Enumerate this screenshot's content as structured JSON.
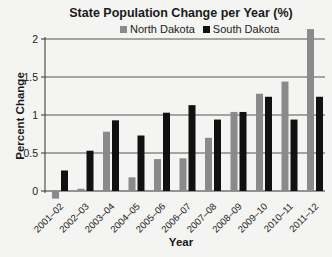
{
  "chart_data": {
    "type": "bar",
    "title": "State Population Change per Year (%)",
    "xlabel": "Year",
    "ylabel": "Percent Change",
    "ylim": [
      0,
      2
    ],
    "yticks": [
      0,
      0.5,
      1,
      1.5,
      2
    ],
    "ytick_labels": [
      "0",
      "0.5",
      "1",
      "1.5",
      "2"
    ],
    "grid": true,
    "legend_position": "top",
    "categories": [
      "2001–02",
      "2002–03",
      "2003–04",
      "2004–05",
      "2005–06",
      "2006–07",
      "2007–08",
      "2008–09",
      "2009–10",
      "2010–11",
      "2011–12"
    ],
    "series": [
      {
        "name": "North Dakota",
        "color": "#8a8a8a",
        "values": [
          -0.1,
          0.03,
          0.78,
          0.18,
          0.42,
          0.43,
          0.7,
          1.04,
          1.28,
          1.44,
          2.13
        ]
      },
      {
        "name": "South Dakota",
        "color": "#111111",
        "values": [
          0.27,
          0.53,
          0.93,
          0.73,
          1.03,
          1.13,
          0.94,
          1.04,
          1.24,
          0.94,
          1.24
        ]
      }
    ]
  }
}
